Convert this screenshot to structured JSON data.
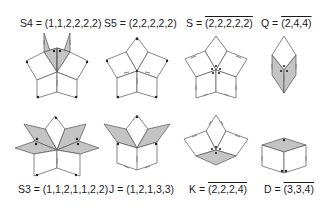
{
  "figure": {
    "shaded_color": "#c4c4c4",
    "line_color": "#555555",
    "configs": [
      {
        "id": "S4",
        "prefix": "S4 = ",
        "tuple": "(1,1,2,2,2,2)",
        "overline": false,
        "row": 1
      },
      {
        "id": "S5",
        "prefix": "S5 = ",
        "tuple": "(2,2,2,2,2)",
        "overline": false,
        "row": 1
      },
      {
        "id": "S",
        "prefix": "S = ",
        "tuple": "(2,2,2,2,2)",
        "overline": true,
        "row": 1
      },
      {
        "id": "Q",
        "prefix": "Q = ",
        "tuple": "(2,4,4)",
        "overline": true,
        "row": 1
      },
      {
        "id": "S3",
        "prefix": "S3 = ",
        "tuple": "(1,1,2,1,1,2,2)",
        "overline": false,
        "row": 2
      },
      {
        "id": "J",
        "prefix": "J = ",
        "tuple": "(1,2,1,3,3)",
        "overline": false,
        "row": 2
      },
      {
        "id": "K",
        "prefix": "K = ",
        "tuple": "(2,2,2,4)",
        "overline": true,
        "row": 2
      },
      {
        "id": "D",
        "prefix": "D = ",
        "tuple": "(3,3,4)",
        "overline": true,
        "row": 2
      }
    ]
  }
}
